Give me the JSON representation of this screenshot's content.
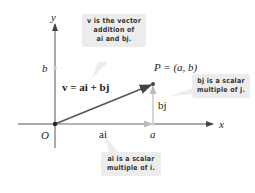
{
  "diagram": {
    "axes": {
      "x_label": "x",
      "y_label": "y",
      "origin_label": "O",
      "x_tick_label": "a",
      "y_tick_label": "b"
    },
    "vectors": {
      "v_label": "v = ai + bj",
      "ai_label": "ai",
      "bj_label": "bj"
    },
    "point": {
      "label": "P = (a, b)"
    },
    "callouts": [
      {
        "line1": "v is the vector",
        "line2": "addition of",
        "line3": "ai and bj."
      },
      {
        "line1": "bj is a scalar",
        "line2": "multiple of j."
      },
      {
        "line1": "ai is a scalar",
        "line2": "multiple of i."
      }
    ],
    "colors": {
      "axis": "#555555",
      "vector_v": "#555555",
      "component": "#b8b8b8",
      "callout_bg": "#ececec",
      "point": "#333333"
    }
  }
}
